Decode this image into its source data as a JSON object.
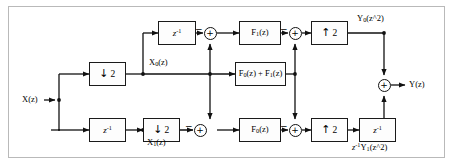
{
  "diagram": {
    "border_color": "#b9b9b9",
    "line_color": "#111111",
    "background": "#ffffff",
    "input": {
      "label": "X(z)"
    },
    "output": {
      "label": "Y(z)"
    },
    "blocks": [
      {
        "id": "delay-in",
        "label": "z",
        "exp": "-1",
        "kind": "delay"
      },
      {
        "id": "down-top",
        "label": "2",
        "arrow": "↓",
        "kind": "downsampler"
      },
      {
        "id": "down-bottom",
        "label": "2",
        "arrow": "↓",
        "kind": "downsampler"
      },
      {
        "id": "delay-top",
        "label": "z",
        "exp": "-1",
        "kind": "delay"
      },
      {
        "id": "filter-top",
        "label": "F",
        "sub": "1",
        "arg": "(z)",
        "kind": "filter"
      },
      {
        "id": "filter-middle",
        "label_full": "middle",
        "kind": "filter"
      },
      {
        "id": "filter-bottom",
        "label": "F",
        "sub": "0",
        "arg": "(z)",
        "kind": "filter"
      },
      {
        "id": "up-top",
        "label": "2",
        "arrow": "↑",
        "kind": "upsampler"
      },
      {
        "id": "up-bottom",
        "label": "2",
        "arrow": "↑",
        "kind": "upsampler"
      },
      {
        "id": "delay-out",
        "label": "z",
        "exp": "-1",
        "kind": "delay"
      }
    ],
    "filter_middle": {
      "f0": "F",
      "f0_sub": "0",
      "f0_arg": "(z)",
      "plus": " + ",
      "f1": "F",
      "f1_sub": "1",
      "f1_arg": "(z)"
    },
    "adders": [
      {
        "id": "adder-top-left",
        "symbol": "+",
        "neg_input": "−"
      },
      {
        "id": "adder-top-right",
        "symbol": "+",
        "neg_input": "−"
      },
      {
        "id": "adder-bottom-left",
        "symbol": "+",
        "neg_input": "−"
      },
      {
        "id": "adder-bottom-right",
        "symbol": "+",
        "neg_input": "−"
      },
      {
        "id": "adder-output",
        "symbol": "+",
        "neg_input": ""
      }
    ],
    "signal_labels": {
      "x0": {
        "base": "X",
        "sub": "0",
        "arg": "(z)"
      },
      "x1": {
        "base": "X",
        "sub": "1",
        "arg": "(z)"
      },
      "y0": {
        "base": "Y",
        "sub": "0",
        "arg": "(z^2)"
      },
      "y1delay": {
        "pre": "z",
        "pre_sup": "-1",
        "base": "Y",
        "sub": "1",
        "arg": "(z^2)"
      }
    }
  }
}
